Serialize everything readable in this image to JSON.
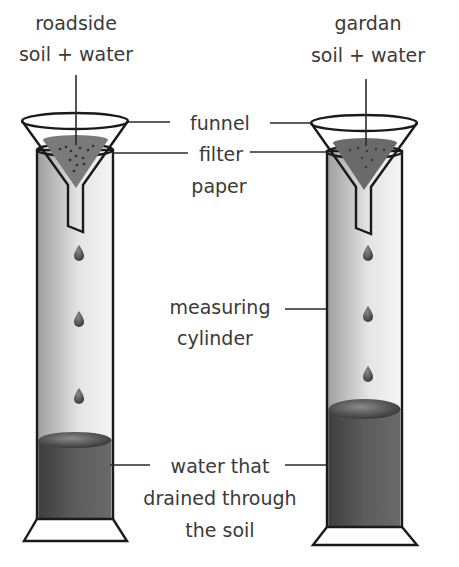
{
  "diagram": {
    "setups": [
      {
        "id": "roadside",
        "label_lines": [
          "roadside",
          "soil + water"
        ],
        "drops": 3,
        "water_surface_y": 440
      },
      {
        "id": "garden",
        "label_lines": [
          "gardan",
          "soil + water"
        ],
        "drops": 3,
        "water_surface_y": 409
      }
    ],
    "labels": {
      "funnel": "funnel",
      "filter_paper": [
        "filter",
        "paper"
      ],
      "measuring_cylinder": [
        "measuring",
        "cylinder"
      ],
      "drained_water": [
        "water that",
        "drained through",
        "the soil"
      ]
    },
    "colors": {
      "outline": "#1a1a1a",
      "glass_light": "#e6e6e6",
      "glass_dark": "#a8a8a8",
      "soil": "#6e6e6e",
      "water": "#555555",
      "text": "#3a3a3a"
    }
  }
}
